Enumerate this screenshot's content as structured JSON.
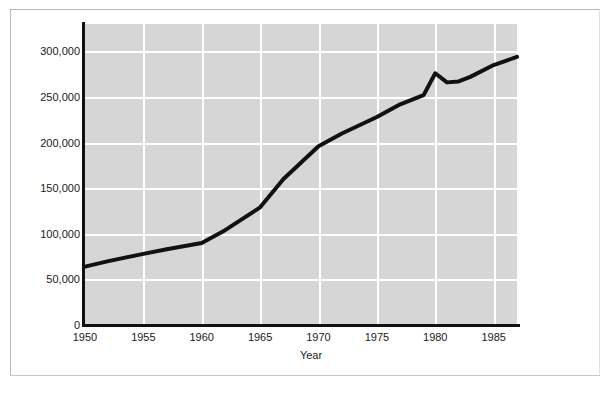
{
  "chart_data": {
    "type": "line",
    "title": "",
    "subtitle": "",
    "xlabel": "Year",
    "ylabel": "",
    "grid": true,
    "legend": false,
    "xlim": [
      1950,
      1987
    ],
    "ylim": [
      0,
      330000
    ],
    "xticks": [
      1950,
      1955,
      1960,
      1965,
      1970,
      1975,
      1980,
      1985
    ],
    "xtick_labels": [
      "1950",
      "1955",
      "1960",
      "1965",
      "1970",
      "1975",
      "1980",
      "1985"
    ],
    "yticks": [
      0,
      50000,
      100000,
      150000,
      200000,
      250000,
      300000
    ],
    "ytick_labels": [
      "0",
      "50,000",
      "100,000",
      "150,000",
      "200,000",
      "250,000",
      "300,000"
    ],
    "series": [
      {
        "name": "value",
        "color": "#111111",
        "line_width": 4,
        "x": [
          1950,
          1952,
          1955,
          1957,
          1960,
          1962,
          1965,
          1967,
          1970,
          1972,
          1975,
          1977,
          1979,
          1980,
          1981,
          1982,
          1983,
          1985,
          1987
        ],
        "values": [
          64000,
          70000,
          78000,
          83000,
          90000,
          104000,
          129000,
          160000,
          196000,
          210000,
          228000,
          242000,
          252000,
          276000,
          266000,
          267000,
          272000,
          285000,
          294000
        ]
      }
    ],
    "colors": {
      "plot_background": "#d6d6d6",
      "gridline": "#ffffff",
      "axis": "#111111",
      "page_background": "#ffffff",
      "frame": "#b8b8b8",
      "tick_text": "#1a1a1a"
    }
  }
}
